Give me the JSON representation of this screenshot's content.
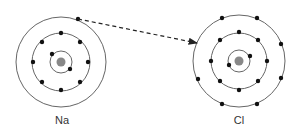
{
  "colors": {
    "shell": "#666666",
    "electron": "#111111",
    "nucleus": "#888888",
    "arrow": "#222222"
  },
  "atoms": [
    {
      "symbol": "Na",
      "center": [
        61,
        62
      ],
      "shell_radii": [
        11,
        29,
        45
      ],
      "electrons": [
        [
          52,
          54
        ],
        [
          70,
          69
        ],
        [
          61,
          33
        ],
        [
          42,
          42
        ],
        [
          80,
          42
        ],
        [
          33,
          62
        ],
        [
          88,
          62
        ],
        [
          42,
          82
        ],
        [
          80,
          82
        ],
        [
          61,
          90
        ],
        [
          78,
          19
        ]
      ],
      "label_pos": [
        62,
        114
      ]
    },
    {
      "symbol": "Cl",
      "center": [
        239,
        61
      ],
      "shell_radii": [
        11,
        28,
        46
      ],
      "electrons": [
        [
          229,
          65
        ],
        [
          250,
          56
        ],
        [
          239,
          32
        ],
        [
          220,
          40
        ],
        [
          258,
          40
        ],
        [
          211,
          61
        ],
        [
          267,
          61
        ],
        [
          220,
          81
        ],
        [
          258,
          81
        ],
        [
          239,
          90
        ],
        [
          222,
          18
        ],
        [
          257,
          18
        ],
        [
          281,
          44
        ],
        [
          281,
          78
        ],
        [
          198,
          79
        ],
        [
          222,
          104
        ],
        [
          257,
          104
        ]
      ],
      "label_pos": [
        239,
        114
      ]
    }
  ],
  "arrow": {
    "from": [
      78,
      19
    ],
    "to": [
      197,
      43
    ],
    "style": "dashed"
  }
}
